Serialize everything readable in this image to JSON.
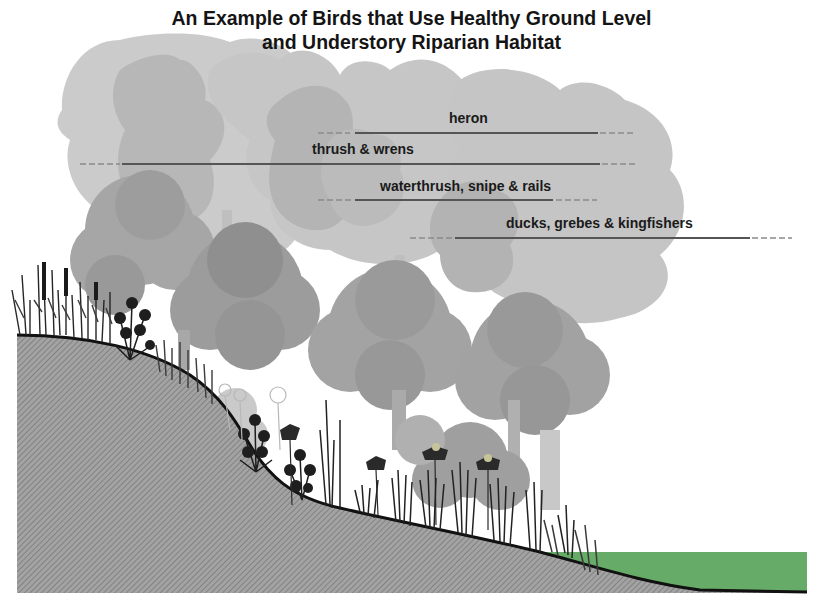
{
  "title": {
    "line1": "An Example of Birds that Use Healthy Ground Level",
    "line2": "and Understory Riparian Habitat"
  },
  "zones": [
    {
      "label": "heron",
      "label_x": 449,
      "label_y": 110,
      "line_y": 133,
      "x_start": 318,
      "x_end": 636
    },
    {
      "label": "thrush & wrens",
      "label_x": 312,
      "label_y": 141,
      "line_y": 164,
      "x_start": 80,
      "x_end": 636
    },
    {
      "label": "waterthrush, snipe & rails",
      "label_x": 380,
      "label_y": 178,
      "line_y": 200,
      "x_start": 318,
      "x_end": 597
    },
    {
      "label": "ducks, grebes & kingfishers",
      "label_x": 506,
      "label_y": 215,
      "line_y": 238,
      "x_start": 410,
      "x_end": 792
    }
  ],
  "elements": {
    "upper_canopy": "tall-tree-silhouettes",
    "mid_canopy": "round-tree-clusters",
    "understory": "shrubs-grasses-flowers",
    "bank": "hatched-soil-slope",
    "water": "river-surface"
  },
  "colors": {
    "title": "#141414",
    "label": "#1a1a1a",
    "tall_tree_light": "#c8c8c8",
    "tall_tree_dark": "#acacac",
    "round_tree": "#9a9a9a",
    "round_tree_dark": "#7d7d7d",
    "ground_fill": "#9c9c9c",
    "ground_line": "#111111",
    "water": "#66ac68",
    "plants": "#1c1c1c",
    "zone_line": "#555555"
  }
}
